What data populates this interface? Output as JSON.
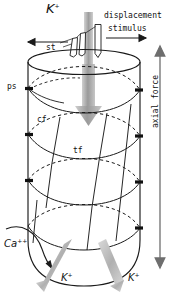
{
  "figure": {
    "type": "biological-diagram"
  },
  "colors": {
    "ink": "#111111",
    "outline": "#1a1a1a",
    "flow_gray": "#b3b3b3",
    "flow_gray_dark": "#8c8c8c",
    "background": "#ffffff"
  },
  "labels": {
    "k_top": "K",
    "k_top_charge": "+",
    "displacement": "displacement",
    "stimulus": "stimulus",
    "st": "st",
    "ps": "ps",
    "cf": "cf",
    "tf": "tf",
    "axial_force": "axial force",
    "ca": "Ca",
    "ca_charge": "++",
    "k_out_left": "K",
    "k_out_left_charge": "+",
    "k_out_right": "K",
    "k_out_right_charge": "+"
  },
  "annotations": [
    {
      "name": "k-influx-band",
      "kind": "gray-vertical-band",
      "meaning": "potassium influx through transduction channel"
    },
    {
      "name": "displacement-arrow",
      "kind": "arrow-right",
      "meaning": "stereocilia bundle displacement direction"
    },
    {
      "name": "left-arrow",
      "kind": "arrow-left",
      "meaning": "opposing displacement direction"
    },
    {
      "name": "intracellular-flow-arrow",
      "kind": "thick-gray-arrow-down",
      "meaning": "ionic current flow into cell body"
    },
    {
      "name": "axial-force-arrow",
      "kind": "double-headed-arrow-vertical",
      "meaning": "axial force along cell long axis"
    },
    {
      "name": "ca-influx-arrow",
      "kind": "curved-arrow",
      "meaning": "calcium entry at cell base"
    },
    {
      "name": "k-efflux-arrow-left",
      "kind": "thick-gray-arrow-down-left",
      "meaning": "potassium efflux at basolateral membrane"
    },
    {
      "name": "k-efflux-arrow-right",
      "kind": "thick-gray-arrow-down-right",
      "meaning": "potassium efflux at basolateral membrane"
    }
  ],
  "structures": [
    {
      "name": "stereocilia",
      "abbrev": "st"
    },
    {
      "name": "plasma-membrane-pleat",
      "abbrev": "ps"
    },
    {
      "name": "circumferential-filament",
      "abbrev": "cf"
    },
    {
      "name": "transverse-filament",
      "abbrev": "tf"
    }
  ]
}
